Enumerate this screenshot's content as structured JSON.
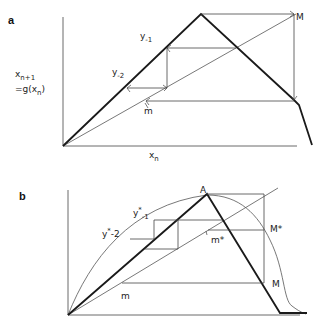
{
  "panels": {
    "a": {
      "letter": "a",
      "y_axis_label_line1": "x",
      "y_axis_label_line1_sub": "n+1",
      "y_axis_label_line2": "=g(x",
      "y_axis_label_line2_sub": "n",
      "y_axis_label_line2_end": ")",
      "x_axis_label": "x",
      "x_axis_label_sub": "n",
      "labels": {
        "y_minus1": "y",
        "y_minus1_sub": "-1",
        "y_minus2": "y",
        "y_minus2_sub": "-2",
        "m": "m",
        "M": "M"
      }
    },
    "b": {
      "letter": "b",
      "labels": {
        "A": "A",
        "y_star_minus1": "y",
        "y_star_minus1_sup": "*",
        "y_star_minus1_sub": "-1",
        "y_star_minus2": "y",
        "y_star_minus2_sup": "*",
        "y_star_minus2_sub": "-2",
        "m_star": "m*",
        "M_star": "M*",
        "M": "M",
        "m": "m"
      }
    }
  },
  "colors": {
    "thick_line": "#1a1a1a",
    "thin_line": "#555555",
    "background": "#ffffff"
  }
}
